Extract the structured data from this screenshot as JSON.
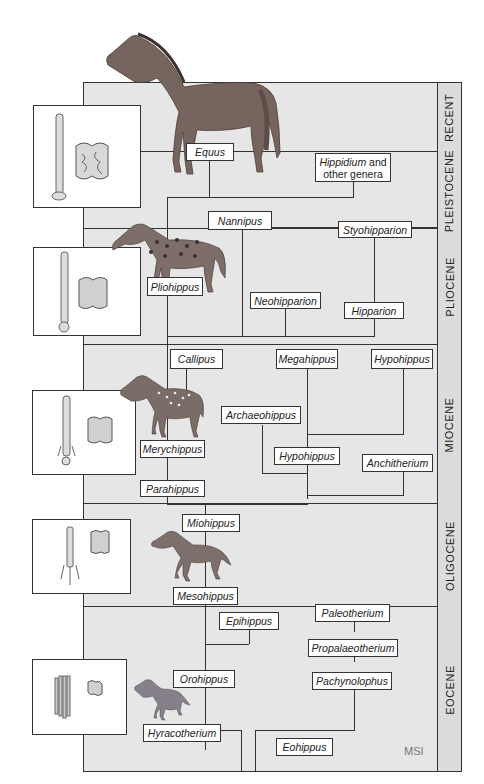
{
  "diagram": {
    "epochs": [
      {
        "id": "recent",
        "label": "RECENT"
      },
      {
        "id": "pleistocene",
        "label": "PLEISTOCENE"
      },
      {
        "id": "pliocene",
        "label": "PLIOCENE"
      },
      {
        "id": "miocene",
        "label": "MIOCENE"
      },
      {
        "id": "oligocene",
        "label": "OLIGOCENE"
      },
      {
        "id": "eocene",
        "label": "EOCENE"
      }
    ],
    "genera": {
      "equus": "Equus",
      "hippidium_italic": "Hippidium",
      "hippidium_rest": " and",
      "hippidium_line2": "other genera",
      "nannipus": "Nannipus",
      "styohipparion": "Styohipparion",
      "pliohippus": "Pliohippus",
      "neohipparion": "Neohipparion",
      "hipparion": "Hipparion",
      "callipus": "Callipus",
      "megahippus": "Megahippus",
      "hypohippus_top": "Hypohippus",
      "archaeohippus": "Archaeohippus",
      "merychippus": "Merychippus",
      "hypohippus_mid": "Hypohippus",
      "anchitherium": "Anchitherium",
      "parahippus": "Parahippus",
      "miohippus": "Miohippus",
      "mesohippus": "Mesohippus",
      "epihippus": "Epihippus",
      "paleotherium": "Paleotherium",
      "propalaeotherium": "Propalaeotherium",
      "orohippus": "Orohippus",
      "pachynolophus": "Pachynolophus",
      "hyracotherium": "Hyracotherium",
      "eohippus": "Eohippus"
    },
    "insets": [
      {
        "epoch": "recent",
        "content": "foot bone and molar"
      },
      {
        "epoch": "pliocene",
        "content": "foot bone and molar"
      },
      {
        "epoch": "miocene",
        "content": "foot bone and molar"
      },
      {
        "epoch": "oligocene",
        "content": "foot bones and molar"
      },
      {
        "epoch": "eocene",
        "content": "foot bones and molar"
      }
    ],
    "signature": "MSI",
    "colors": {
      "background": "#e6e6e6",
      "line": "#333333",
      "box": "#ffffff",
      "horse": "#7a6a64"
    }
  }
}
